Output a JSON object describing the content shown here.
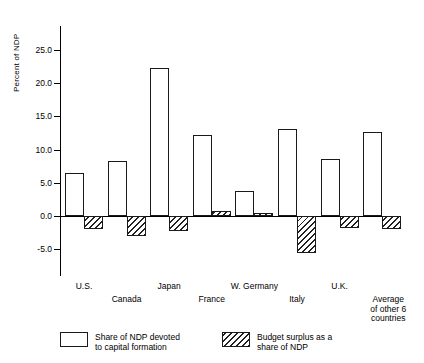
{
  "chart_data": {
    "type": "bar",
    "title": "",
    "xlabel": "",
    "ylabel": "Percent of NDP",
    "ylim": [
      -7.5,
      27.0
    ],
    "yticks": [
      -5.0,
      0.0,
      5.0,
      10.0,
      15.0,
      20.0,
      25.0
    ],
    "ytick_labels": [
      "-5.0",
      "0.0",
      "5.0",
      "10.0",
      "15.0",
      "20.0",
      "25.0"
    ],
    "grid": false,
    "legend_position": "bottom",
    "categories": [
      "U.S.",
      "Canada",
      "Japan",
      "France",
      "W. Germany",
      "Italy",
      "U.K.",
      "Average\nof other 6\ncountries"
    ],
    "series": [
      {
        "name": "Share of NDP devoted\nto capital formation",
        "style": "outline",
        "values": [
          6.5,
          8.3,
          22.3,
          12.2,
          3.8,
          13.1,
          8.6,
          12.6
        ]
      },
      {
        "name": "Budget surplus as a\nshare of NDP",
        "style": "hatched",
        "values": [
          -2.0,
          -3.0,
          -2.2,
          0.7,
          0.4,
          -5.5,
          -1.8,
          -1.9
        ]
      }
    ]
  },
  "legend": {
    "items": [
      {
        "label": "Share of NDP devoted\nto capital formation",
        "swatch": "solid-swatch"
      },
      {
        "label": "Budget surplus as a\nshare of NDP",
        "swatch": "hatched-swatch"
      }
    ]
  }
}
